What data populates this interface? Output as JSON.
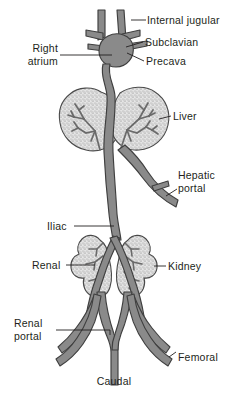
{
  "figure": {
    "background_color": "#ffffff",
    "vessel_fill": "#8a8a8a",
    "vessel_stroke": "#3f3f3f",
    "organ_fill": "#e2e2e2",
    "organ_stroke": "#4a4a4a",
    "label_color": "#231f20",
    "leader_color": "#231f20"
  },
  "labels": {
    "internal_jugular": "Internal jugular",
    "subclavian": "Subclavian",
    "precava": "Precava",
    "right_atrium": "Right\natrium",
    "right_atrium_line1": "Right",
    "right_atrium_line2": "atrium",
    "liver": "Liver",
    "hepatic_portal_line1": "Hepatic",
    "hepatic_portal_line2": "portal",
    "iliac": "Iliac",
    "renal": "Renal",
    "kidney": "Kidney",
    "renal_portal_line1": "Renal",
    "renal_portal_line2": "portal",
    "femoral": "Femoral",
    "caudal": "Caudal"
  },
  "structures": [
    {
      "name": "internal-jugular-vein",
      "type": "vessel",
      "count": 2
    },
    {
      "name": "subclavian-vein",
      "type": "vessel",
      "count": 2
    },
    {
      "name": "precava",
      "type": "vessel",
      "count": 2
    },
    {
      "name": "right-atrium",
      "type": "chamber",
      "count": 1
    },
    {
      "name": "postcava",
      "type": "vessel",
      "count": 1
    },
    {
      "name": "liver",
      "type": "organ",
      "count": 1
    },
    {
      "name": "hepatic-portal-vein",
      "type": "vessel",
      "count": 1
    },
    {
      "name": "iliac-vein",
      "type": "vessel",
      "count": 2
    },
    {
      "name": "renal-vein",
      "type": "vessel",
      "count": 2
    },
    {
      "name": "kidney",
      "type": "organ",
      "count": 2
    },
    {
      "name": "renal-portal-vein",
      "type": "vessel",
      "count": 2
    },
    {
      "name": "femoral-vein",
      "type": "vessel",
      "count": 2
    },
    {
      "name": "caudal-vein",
      "type": "vessel",
      "count": 1
    }
  ]
}
